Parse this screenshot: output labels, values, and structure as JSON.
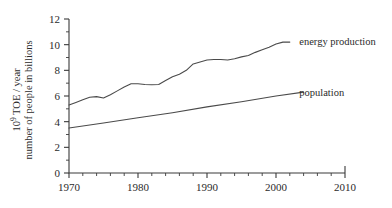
{
  "chart_data": {
    "type": "line",
    "title": "",
    "xlabel": "",
    "ylabel": "10⁹ TOE / year  number of people in billions",
    "ylabel_line1": "10",
    "ylabel_line1_sup": "9",
    "ylabel_line1_rest": " TOE / year",
    "ylabel_line2": "number of people in billions",
    "xlim": [
      1970,
      2010
    ],
    "ylim": [
      0,
      12
    ],
    "x_ticks_major": [
      1970,
      1980,
      1990,
      2000,
      2010
    ],
    "x_tick_labels": [
      "1970",
      "1980",
      "1990",
      "2000",
      "2010"
    ],
    "x_minor_step": 2,
    "y_ticks_major": [
      0,
      2,
      4,
      6,
      8,
      10,
      12
    ],
    "y_tick_labels": [
      "0",
      "2",
      "4",
      "6",
      "8",
      "10",
      "12"
    ],
    "y_minor_step": 1,
    "grid": false,
    "legend_position": "right-inline",
    "line_color": "#4a4a4a",
    "axis_color": "#3a3a3a",
    "series": [
      {
        "name": "energy production",
        "label": "energy production",
        "label_x": 2002.5,
        "label_y": 10.25,
        "x": [
          1970,
          1971,
          1972,
          1973,
          1974,
          1975,
          1976,
          1977,
          1978,
          1979,
          1980,
          1981,
          1982,
          1983,
          1984,
          1985,
          1986,
          1987,
          1988,
          1989,
          1990,
          1991,
          1992,
          1993,
          1994,
          1995,
          1996,
          1997,
          1998,
          1999,
          2000,
          2001,
          2002
        ],
        "values": [
          5.3,
          5.5,
          5.7,
          5.9,
          5.95,
          5.85,
          6.1,
          6.4,
          6.7,
          6.95,
          6.95,
          6.9,
          6.88,
          6.9,
          7.2,
          7.5,
          7.7,
          8.0,
          8.5,
          8.65,
          8.8,
          8.85,
          8.85,
          8.8,
          8.9,
          9.05,
          9.15,
          9.4,
          9.6,
          9.8,
          10.05,
          10.2,
          10.2
        ]
      },
      {
        "name": "population",
        "label": "population",
        "label_x": 2002.5,
        "label_y": 6.35,
        "x": [
          1970,
          1975,
          1980,
          1985,
          1990,
          1995,
          2000,
          2004
        ],
        "values": [
          3.5,
          3.9,
          4.3,
          4.7,
          5.15,
          5.55,
          6.0,
          6.3
        ]
      }
    ]
  }
}
